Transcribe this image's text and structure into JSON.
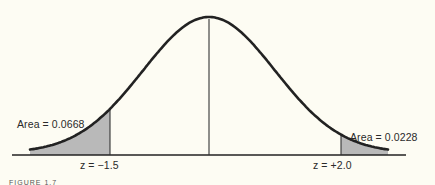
{
  "figure": {
    "left_area_label": "Area = 0.0668",
    "right_area_label": "Area = 0.0228",
    "left_z_label": "z = −1.5",
    "right_z_label": "z = +2.0",
    "caption_fragment": "FIGURE 1.7"
  },
  "colors": {
    "background": "#fdfcf3",
    "curve": "#222222",
    "shading": "#b9b9b9"
  },
  "chart_data": {
    "type": "area",
    "distribution": "standard normal",
    "mean": 0,
    "shaded_regions": [
      {
        "side": "left",
        "z_cutoff": -1.5,
        "area": 0.0668
      },
      {
        "side": "right",
        "z_cutoff": 2.0,
        "area": 0.0228
      }
    ],
    "annotations": [
      "Area = 0.0668",
      "Area = 0.0228",
      "z = −1.5",
      "z = +2.0"
    ],
    "center_line": 0
  }
}
